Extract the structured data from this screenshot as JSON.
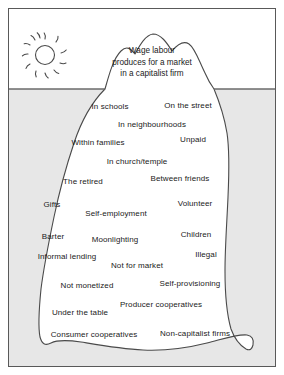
{
  "diagram": {
    "title_lines": [
      "Wage labour",
      "produces for a market",
      "in a capitalist firm"
    ],
    "sun_icon": "sun-icon",
    "waterline_label": "waterline",
    "colors": {
      "water": "#e7e7e7",
      "sky": "#ffffff",
      "iceberg": "#ffffff",
      "outline": "#4a4a4a",
      "frame": "#595959",
      "text": "#1a1a1a"
    },
    "above_water_labels": [],
    "below_water_labels": [
      {
        "text": "In schools",
        "x": 101,
        "y": 92,
        "align": "center"
      },
      {
        "text": "On the street",
        "x": 179,
        "y": 91,
        "align": "center"
      },
      {
        "text": "In neighbourhoods",
        "x": 143,
        "y": 110,
        "align": "center"
      },
      {
        "text": "Within families",
        "x": 89,
        "y": 128,
        "align": "center"
      },
      {
        "text": "Unpaid",
        "x": 184,
        "y": 125,
        "align": "center"
      },
      {
        "text": "In church/temple",
        "x": 128,
        "y": 147,
        "align": "center"
      },
      {
        "text": "The retired",
        "x": 74,
        "y": 167,
        "align": "center"
      },
      {
        "text": "Between friends",
        "x": 171,
        "y": 164,
        "align": "center"
      },
      {
        "text": "Gifts",
        "x": 43,
        "y": 190,
        "align": "center"
      },
      {
        "text": "Volunteer",
        "x": 186,
        "y": 189,
        "align": "center"
      },
      {
        "text": "Self-employment",
        "x": 107,
        "y": 199,
        "align": "center"
      },
      {
        "text": "Barter",
        "x": 44,
        "y": 222,
        "align": "center"
      },
      {
        "text": "Moonlighting",
        "x": 106,
        "y": 225,
        "align": "center"
      },
      {
        "text": "Children",
        "x": 187,
        "y": 220,
        "align": "center"
      },
      {
        "text": "Informal lending",
        "x": 58,
        "y": 242,
        "align": "center"
      },
      {
        "text": "Illegal",
        "x": 197,
        "y": 240,
        "align": "center"
      },
      {
        "text": "Not for market",
        "x": 128,
        "y": 251,
        "align": "center"
      },
      {
        "text": "Not monetized",
        "x": 78,
        "y": 271,
        "align": "center"
      },
      {
        "text": "Self-provisioning",
        "x": 181,
        "y": 269,
        "align": "center"
      },
      {
        "text": "Producer cooperatives",
        "x": 152,
        "y": 290,
        "align": "center"
      },
      {
        "text": "Under the table",
        "x": 71,
        "y": 298,
        "align": "center"
      },
      {
        "text": "Consumer cooperatives",
        "x": 85,
        "y": 320,
        "align": "center"
      },
      {
        "text": "Non-capitalist firms",
        "x": 186,
        "y": 319,
        "align": "center"
      }
    ]
  }
}
